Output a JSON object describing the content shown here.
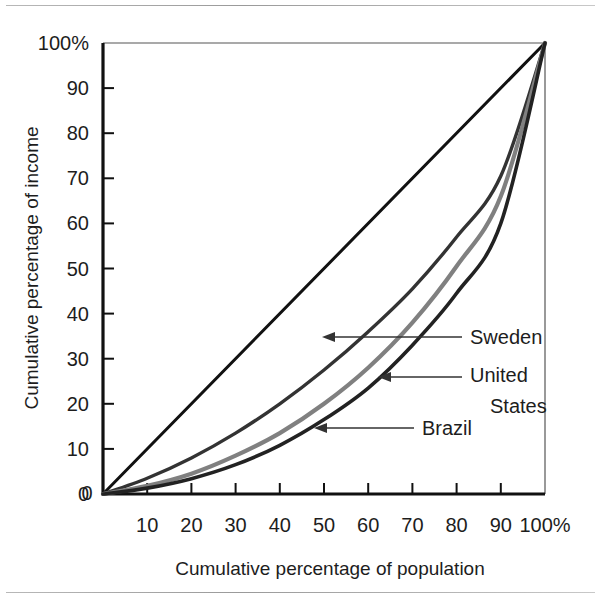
{
  "figure": {
    "background_color": "#ffffff",
    "rule_color": "#9a9a9a",
    "plot_frame_color": "#111111"
  },
  "chart_data": {
    "type": "line",
    "title": "",
    "subtitle": "",
    "xlabel": "Cumulative percentage of population",
    "ylabel": "Cumulative percentage of income",
    "xlim": [
      0,
      100
    ],
    "ylim": [
      0,
      100
    ],
    "grid": false,
    "legend_position": "inline-annotations",
    "x_tick_labels": [
      "0",
      "10",
      "20",
      "30",
      "40",
      "50",
      "60",
      "70",
      "80",
      "90",
      "100%"
    ],
    "x_ticks": [
      0,
      10,
      20,
      30,
      40,
      50,
      60,
      70,
      80,
      90,
      100
    ],
    "y_tick_labels": [
      "0",
      "10",
      "20",
      "30",
      "40",
      "50",
      "60",
      "70",
      "80",
      "90",
      "100%"
    ],
    "y_ticks": [
      0,
      10,
      20,
      30,
      40,
      50,
      60,
      70,
      80,
      90,
      100
    ],
    "x": [
      0,
      10,
      20,
      30,
      40,
      50,
      60,
      70,
      80,
      90,
      100
    ],
    "series": [
      {
        "name": "Line of equality",
        "color": "#111111",
        "width": 3,
        "labeled": false,
        "values": [
          0,
          10,
          20,
          30,
          40,
          50,
          60,
          70,
          80,
          90,
          100
        ]
      },
      {
        "name": "Sweden",
        "color": "#333333",
        "width": 3.4,
        "labeled": true,
        "values": [
          0,
          3.5,
          8,
          13.5,
          20,
          27.5,
          36,
          45.5,
          57,
          70.5,
          100
        ]
      },
      {
        "name": "United States",
        "color": "#808080",
        "width": 4.2,
        "labeled": true,
        "values": [
          0,
          1.8,
          4.5,
          8.5,
          13.5,
          20,
          28,
          38,
          50.5,
          66,
          100
        ]
      },
      {
        "name": "Brazil",
        "color": "#222222",
        "width": 3.6,
        "labeled": true,
        "values": [
          0,
          1.3,
          3.4,
          6.5,
          10.8,
          16.5,
          23.5,
          33,
          44.5,
          60,
          100
        ]
      }
    ],
    "annotations": [
      {
        "label": "Sweden",
        "target_x": 50,
        "target_y": 35
      },
      {
        "label": "United States",
        "label_line1": "United",
        "label_line2": "States",
        "target_x": 62,
        "target_y": 25
      },
      {
        "label": "Brazil",
        "target_x": 48,
        "target_y": 15
      }
    ]
  }
}
